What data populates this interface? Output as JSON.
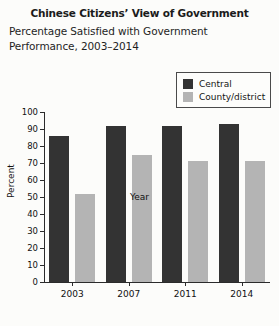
{
  "header": {
    "title": "Chinese Citizens’ View of Government",
    "subtitle": "Percentage Satisfied with Government Performance, 2003–2014"
  },
  "legend": {
    "position": "top-right",
    "entries": [
      {
        "label": "Central",
        "color": "#333333"
      },
      {
        "label": "County/district",
        "color": "#b4b4b4"
      }
    ]
  },
  "chart_data": {
    "type": "bar",
    "title": "Chinese Citizens’ View of Government",
    "subtitle": "Percentage Satisfied with Government Performance, 2003–2014",
    "categories": [
      "2003",
      "2007",
      "2011",
      "2014"
    ],
    "series": [
      {
        "name": "Central",
        "color": "#333333",
        "values": [
          86,
          92,
          92,
          93
        ]
      },
      {
        "name": "County/district",
        "color": "#b4b4b4",
        "values": [
          52,
          75,
          71,
          71
        ]
      }
    ],
    "xlabel": "Year",
    "ylabel": "Percent",
    "ylim": [
      0,
      100
    ],
    "yticks": [
      0,
      10,
      20,
      30,
      40,
      50,
      60,
      70,
      80,
      90,
      100
    ],
    "grid": false,
    "legend_position": "top-right"
  }
}
